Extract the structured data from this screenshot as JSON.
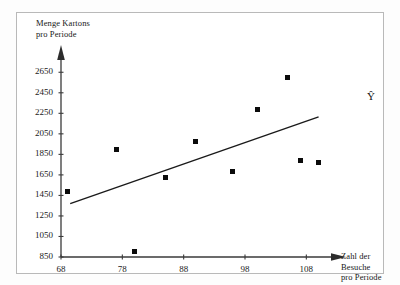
{
  "chart_data": {
    "type": "scatter",
    "title": "",
    "ylabel": "Menge Kartons\npro Periode",
    "xlabel": "Zahl der Besuche\npro Periode",
    "series_label": "Ŷ",
    "grid": false,
    "legend": "none",
    "xlim": [
      68,
      113
    ],
    "ylim": [
      850,
      2750
    ],
    "xticks": [
      68,
      78,
      88,
      98,
      108
    ],
    "yticks": [
      850,
      1050,
      1250,
      1450,
      1650,
      1850,
      2050,
      2250,
      2450,
      2650
    ],
    "points": [
      {
        "x": 69,
        "y": 1490
      },
      {
        "x": 77,
        "y": 1895
      },
      {
        "x": 80,
        "y": 905
      },
      {
        "x": 85,
        "y": 1625
      },
      {
        "x": 90,
        "y": 1980
      },
      {
        "x": 96,
        "y": 1680
      },
      {
        "x": 100,
        "y": 2285
      },
      {
        "x": 105,
        "y": 2600
      },
      {
        "x": 107,
        "y": 1790
      },
      {
        "x": 110,
        "y": 1770
      }
    ],
    "regression_line": {
      "x1": 69.5,
      "y1": 1370,
      "x2": 110,
      "y2": 2215
    },
    "marker": "square",
    "marker_color": "#0b0b0b",
    "line_color": "#1a1a1a",
    "axis_color": "#3a3a3a"
  }
}
